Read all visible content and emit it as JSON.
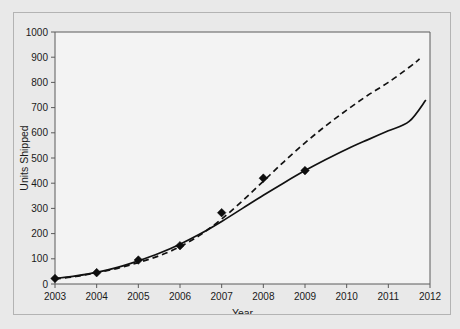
{
  "figure": {
    "background_color": "#e9e9e9",
    "plot_background_color": "#f3f3f3",
    "border_color": "#b3b3b3"
  },
  "chart_data": {
    "type": "scatter",
    "title": "",
    "xlabel": "Year",
    "ylabel": "Units Shipped",
    "xlim": [
      2003,
      2012
    ],
    "ylim": [
      0,
      1000
    ],
    "grid": false,
    "legend": "none",
    "xticks": [
      2003,
      2004,
      2005,
      2006,
      2007,
      2008,
      2009,
      2010,
      2011,
      2012
    ],
    "xtick_labels": [
      "2003",
      "2004",
      "2005",
      "2006",
      "2007",
      "2008",
      "2009",
      "2010",
      "2011",
      "2012"
    ],
    "yticks": [
      0,
      100,
      200,
      300,
      400,
      500,
      600,
      700,
      800,
      900,
      1000
    ],
    "ytick_labels": [
      "0",
      "100",
      "200",
      "300",
      "400",
      "500",
      "600",
      "700",
      "800",
      "900",
      "1000"
    ],
    "x": [
      2003,
      2004,
      2005,
      2006,
      2007,
      2008,
      2009
    ],
    "values": [
      22,
      45,
      95,
      152,
      283,
      420,
      450
    ],
    "marker": "diamond",
    "marker_color": "#0d0d0d",
    "series": [
      {
        "name": "data-points",
        "style": "markers",
        "x": [
          2003,
          2004,
          2005,
          2006,
          2007,
          2008,
          2009
        ],
        "values": [
          22,
          45,
          95,
          152,
          283,
          420,
          450
        ]
      },
      {
        "name": "solid-trend",
        "style": "solid",
        "color": "#111111",
        "x": [
          2003.0,
          2003.5,
          2004.0,
          2004.5,
          2005.0,
          2005.5,
          2006.0,
          2006.5,
          2007.0,
          2007.5,
          2008.0,
          2008.5,
          2009.0,
          2009.5,
          2010.0,
          2010.5,
          2011.0,
          2011.5,
          2011.9
        ],
        "values": [
          22,
          32,
          46,
          66,
          92,
          122,
          158,
          200,
          248,
          300,
          352,
          402,
          450,
          494,
          535,
          572,
          608,
          645,
          730
        ]
      },
      {
        "name": "dashed-trend",
        "style": "dashed",
        "color": "#111111",
        "x": [
          2003.0,
          2003.5,
          2004.0,
          2004.5,
          2005.0,
          2005.5,
          2006.0,
          2006.5,
          2007.0,
          2007.5,
          2008.0,
          2008.5,
          2009.0,
          2009.5,
          2010.0,
          2010.5,
          2011.0,
          2011.5,
          2011.75
        ],
        "values": [
          20,
          30,
          45,
          62,
          85,
          112,
          148,
          196,
          258,
          330,
          408,
          486,
          560,
          628,
          690,
          748,
          800,
          860,
          893
        ]
      }
    ]
  }
}
